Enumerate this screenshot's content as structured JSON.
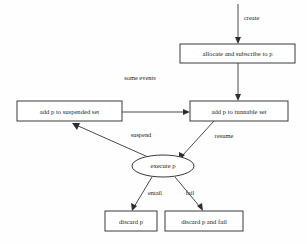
{
  "diagram": {
    "background_color": "#fefefe",
    "stroke_color": "#3a3a3a",
    "text_color": "#1c1c1c",
    "width": 307,
    "height": 244,
    "nodes": [
      {
        "id": "allocate",
        "label": "allocate and subscribe to p",
        "shape": "rectangle",
        "x": 180,
        "y": 44,
        "w": 115,
        "h": 19
      },
      {
        "id": "suspended",
        "label": "add p to suspended set",
        "shape": "rectangle",
        "x": 17,
        "y": 101,
        "w": 105,
        "h": 20
      },
      {
        "id": "runnable",
        "label": "add p to runnable set",
        "shape": "rectangle",
        "x": 190,
        "y": 101,
        "w": 98,
        "h": 20
      },
      {
        "id": "execute",
        "label": "execute p",
        "shape": "ellipse",
        "cx": 163,
        "cy": 166,
        "rx": 31,
        "ry": 11
      },
      {
        "id": "discard",
        "label": "discard p",
        "shape": "rectangle",
        "x": 105,
        "y": 211,
        "w": 52,
        "h": 20
      },
      {
        "id": "discard-fail",
        "label": "discard p and fail",
        "shape": "rectangle",
        "x": 165,
        "y": 211,
        "w": 78,
        "h": 20
      }
    ],
    "edges": [
      {
        "id": "create",
        "label": "create",
        "from": "entry-point",
        "to": "allocate",
        "label_x": 244,
        "label_y": 19
      },
      {
        "id": "allocate-to-runnable",
        "label": "",
        "from": "allocate",
        "to": "runnable",
        "label_x": 0,
        "label_y": 0
      },
      {
        "id": "some-events",
        "label": "some events",
        "from": "suspended",
        "to": "runnable",
        "label_x": 140,
        "label_y": 79
      },
      {
        "id": "suspend",
        "label": "suspend",
        "from": "execute",
        "to": "suspended",
        "label_x": 141,
        "label_y": 136
      },
      {
        "id": "resume",
        "label": "resume",
        "from": "runnable",
        "to": "execute",
        "label_x": 224,
        "label_y": 137
      },
      {
        "id": "entail",
        "label": "entail",
        "from": "execute",
        "to": "discard",
        "label_x": 155,
        "label_y": 194
      },
      {
        "id": "fail",
        "label": "fail",
        "from": "execute",
        "to": "discard-fail",
        "label_x": 190,
        "label_y": 194
      }
    ]
  }
}
